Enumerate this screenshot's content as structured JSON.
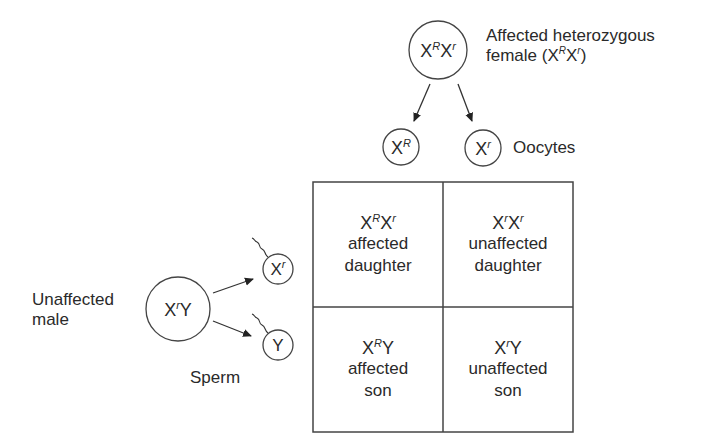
{
  "female": {
    "genotype": {
      "base1": "X",
      "sup1": "R",
      "base2": "X",
      "sup2": "r"
    },
    "label_line1": "Affected heterozygous",
    "label_line2_prefix": "female (",
    "label_line2_geno": {
      "base1": "X",
      "sup1": "R",
      "base2": "X",
      "sup2": "r"
    },
    "label_line2_suffix": ")"
  },
  "oocytes": {
    "label": "Oocytes",
    "items": [
      {
        "base": "X",
        "sup": "R"
      },
      {
        "base": "X",
        "sup": "r"
      }
    ]
  },
  "male": {
    "genotype": {
      "base1": "X",
      "sup1": "r",
      "base2": "Y"
    },
    "label_line1": "Unaffected",
    "label_line2": "male"
  },
  "sperm": {
    "label": "Sperm",
    "items": [
      {
        "base": "X",
        "sup": "r"
      },
      {
        "base": "Y",
        "sup": ""
      }
    ]
  },
  "punnett": {
    "cells": [
      {
        "geno_base1": "X",
        "geno_sup1": "R",
        "geno_base2": "X",
        "geno_sup2": "r",
        "line1": "affected",
        "line2": "daughter"
      },
      {
        "geno_base1": "X",
        "geno_sup1": "r",
        "geno_base2": "X",
        "geno_sup2": "r",
        "line1": "unaffected",
        "line2": "daughter"
      },
      {
        "geno_base1": "X",
        "geno_sup1": "R",
        "geno_base2": "Y",
        "geno_sup2": "",
        "line1": "affected",
        "line2": "son"
      },
      {
        "geno_base1": "X",
        "geno_sup1": "r",
        "geno_base2": "Y",
        "geno_sup2": "",
        "line1": "unaffected",
        "line2": "son"
      }
    ]
  },
  "colors": {
    "line": "#333333",
    "text": "#2a2a2a",
    "background": "#ffffff"
  }
}
